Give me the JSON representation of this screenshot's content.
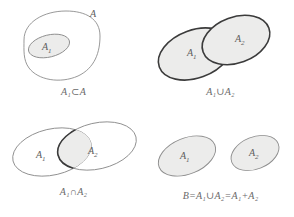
{
  "figure": {
    "background_color": "#ffffff",
    "shade_color": "#ececeb",
    "thin_stroke_color": "#8d8d8d",
    "thick_stroke_color": "#3b3b3b",
    "caption_color": "#6a6a6a"
  },
  "panels": [
    {
      "id": "subset",
      "caption": "A₁⊂A",
      "labels": {
        "outer": "A",
        "inner_name": "A",
        "inner_sub": "1"
      },
      "description": "Small shaded ellipse A1 contained inside a large unshaded blob A"
    },
    {
      "id": "union",
      "caption": "A₁∪A₂",
      "labels": {
        "left_name": "A",
        "left_sub": "1",
        "right_name": "A",
        "right_sub": "2"
      },
      "description": "Two overlapping tilted ellipses, both shaded, thick outline around the union"
    },
    {
      "id": "intersection",
      "caption": "A₁∩A₂",
      "labels": {
        "left_name": "A",
        "left_sub": "1",
        "right_name": "A",
        "right_sub": "2"
      },
      "description": "Two overlapping tilted ellipses with thin outlines, only the lens-shaped intersection shaded with thick outline"
    },
    {
      "id": "disjoint",
      "caption": "B=A₁∪A₂=A₁+A₂",
      "labels": {
        "left_name": "A",
        "left_sub": "1",
        "right_name": "A",
        "right_sub": "2"
      },
      "description": "Two separate shaded tilted ellipses that do not overlap"
    }
  ]
}
